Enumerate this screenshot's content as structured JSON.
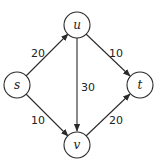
{
  "diagram": {
    "type": "flow-network",
    "nodes": [
      {
        "id": "s",
        "label": "s",
        "x": 17,
        "y": 85
      },
      {
        "id": "u",
        "label": "u",
        "x": 77,
        "y": 25
      },
      {
        "id": "v",
        "label": "v",
        "x": 77,
        "y": 145
      },
      {
        "id": "t",
        "label": "t",
        "x": 140,
        "y": 85
      }
    ],
    "edges": [
      {
        "from": "s",
        "to": "u",
        "capacity": "20"
      },
      {
        "from": "s",
        "to": "v",
        "capacity": "10"
      },
      {
        "from": "u",
        "to": "v",
        "capacity": "30"
      },
      {
        "from": "u",
        "to": "t",
        "capacity": "10"
      },
      {
        "from": "v",
        "to": "t",
        "capacity": "20"
      }
    ]
  },
  "colors": {
    "stroke": "#2a2a2a",
    "text": "#222222",
    "background": "#ffffff"
  }
}
